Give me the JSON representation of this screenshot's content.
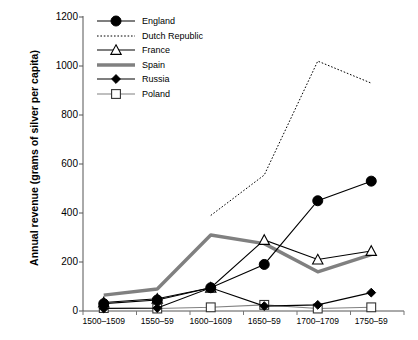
{
  "chart_data": {
    "type": "line",
    "title": "",
    "xlabel": "",
    "ylabel": "Annual revenue (grams of silver per capita)",
    "categories": [
      "1500–1509",
      "1550–59",
      "1600–1609",
      "1650–59",
      "1700–1709",
      "1750–59"
    ],
    "ylim": [
      0,
      1200
    ],
    "yticks": [
      0,
      200,
      400,
      600,
      800,
      1000,
      1200
    ],
    "grid": false,
    "legend_position": "top-left inside plot",
    "series": [
      {
        "name": "England",
        "color": "#000000",
        "marker": "filled-circle",
        "style": "solid",
        "values": [
          30,
          45,
          95,
          190,
          450,
          530
        ]
      },
      {
        "name": "Dutch Republic",
        "color": "#000000",
        "marker": "none",
        "style": "dotted",
        "values": [
          null,
          null,
          390,
          555,
          1020,
          930
        ]
      },
      {
        "name": "France",
        "color": "#000000",
        "marker": "open-triangle",
        "style": "solid",
        "values": [
          35,
          50,
          95,
          290,
          210,
          245
        ]
      },
      {
        "name": "Spain",
        "color": "#808080",
        "marker": "none",
        "style": "thick-solid",
        "values": [
          65,
          90,
          310,
          275,
          160,
          230
        ]
      },
      {
        "name": "Russia",
        "color": "#000000",
        "marker": "filled-diamond",
        "style": "solid",
        "values": [
          10,
          12,
          95,
          20,
          25,
          75
        ]
      },
      {
        "name": "Poland",
        "color": "#808080",
        "marker": "open-square",
        "style": "solid",
        "values": [
          12,
          10,
          15,
          25,
          10,
          15
        ]
      }
    ]
  },
  "legend": {
    "items": [
      {
        "label": "England"
      },
      {
        "label": "Dutch Republic"
      },
      {
        "label": "France"
      },
      {
        "label": "Spain"
      },
      {
        "label": "Russia"
      },
      {
        "label": "Poland"
      }
    ]
  }
}
